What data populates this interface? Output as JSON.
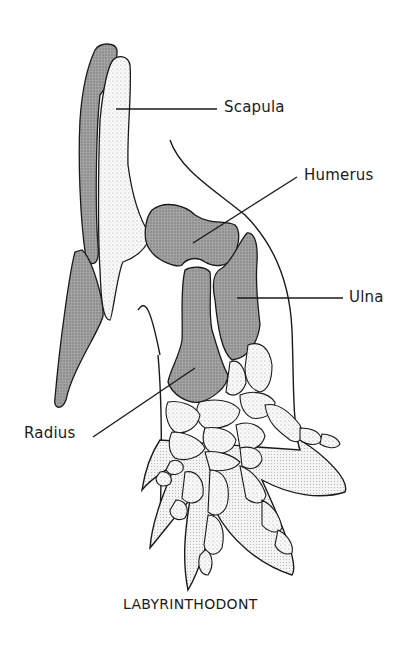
{
  "figure": {
    "caption": "LABYRINTHODONT",
    "labels": {
      "scapula": "Scapula",
      "humerus": "Humerus",
      "ulna": "Ulna",
      "radius": "Radius"
    },
    "colors": {
      "dark_bone": "#9a9a9a",
      "light_bone": "#eeeeee",
      "outline": "#1a1a1a",
      "background": "#ffffff"
    }
  }
}
